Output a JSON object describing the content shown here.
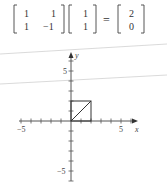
{
  "equation": {
    "matrix": [
      [
        "1",
        "1"
      ],
      [
        "1",
        "−1"
      ]
    ],
    "vector": [
      "1",
      "1"
    ],
    "equals": "=",
    "result": [
      "2",
      "0"
    ]
  },
  "chart_data": {
    "type": "line",
    "title": "",
    "xlabel": "x",
    "ylabel": "y",
    "xlim": [
      -5,
      6
    ],
    "ylim": [
      -6,
      7
    ],
    "x_tick_labels": [
      "−5",
      "5"
    ],
    "y_tick_labels": [
      "5",
      "−5"
    ],
    "tick_step": 1,
    "grid": false,
    "shapes": [
      {
        "name": "square",
        "points": [
          [
            0,
            0
          ],
          [
            2,
            0
          ],
          [
            2,
            2
          ],
          [
            0,
            2
          ],
          [
            0,
            0
          ]
        ]
      },
      {
        "name": "diagonal",
        "points": [
          [
            0,
            0
          ],
          [
            2,
            2
          ]
        ]
      }
    ]
  },
  "colors": {
    "ink": "#333333",
    "guide_lines": "#cccccc"
  }
}
